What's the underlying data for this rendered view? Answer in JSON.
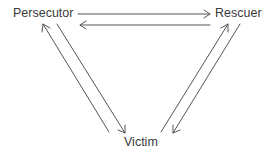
{
  "diagram": {
    "type": "drama-triangle",
    "nodes": [
      {
        "id": "persecutor",
        "label": "Persecutor"
      },
      {
        "id": "rescuer",
        "label": "Rescuer"
      },
      {
        "id": "victim",
        "label": "Victim"
      }
    ],
    "edges": [
      {
        "from": "persecutor",
        "to": "rescuer"
      },
      {
        "from": "rescuer",
        "to": "persecutor"
      },
      {
        "from": "persecutor",
        "to": "victim"
      },
      {
        "from": "victim",
        "to": "persecutor"
      },
      {
        "from": "rescuer",
        "to": "victim"
      },
      {
        "from": "victim",
        "to": "rescuer"
      }
    ],
    "colors": {
      "line": "#555555",
      "text": "#3a3a3a"
    }
  }
}
